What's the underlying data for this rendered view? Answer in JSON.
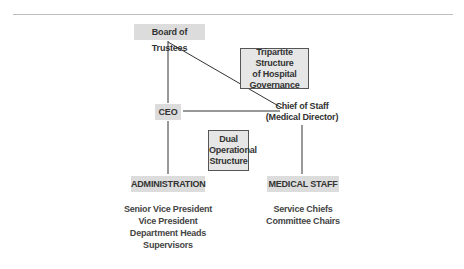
{
  "diagram": {
    "nodes": {
      "board": "Board of Trustees",
      "ceo": "CEO",
      "chief_of_staff": [
        "Chief of Staff",
        "(Medical Director)"
      ],
      "administration": "ADMINISTRATION",
      "medical_staff": "MEDICAL STAFF"
    },
    "notes": {
      "tripartite": [
        "Tripartite Structure",
        "of Hospital",
        "Governance"
      ],
      "dual": [
        "Dual",
        "Operational",
        "Structure"
      ]
    },
    "lists": {
      "administration": [
        "Senior Vice President",
        "Vice President",
        "Department Heads",
        "Supervisors"
      ],
      "medical_staff": [
        "Service Chiefs",
        "Committee Chairs"
      ]
    },
    "edges": [
      {
        "from": "Board of Trustees",
        "to": "CEO"
      },
      {
        "from": "Board of Trustees",
        "to": "Chief of Staff"
      },
      {
        "from": "CEO",
        "to": "Chief of Staff"
      },
      {
        "from": "CEO",
        "to": "ADMINISTRATION"
      },
      {
        "from": "Chief of Staff",
        "to": "MEDICAL STAFF"
      }
    ],
    "colors": {
      "box_fill": "#dcdcdc",
      "note_fill": "#e6e6e6",
      "line": "#333333",
      "text": "#333333"
    }
  }
}
